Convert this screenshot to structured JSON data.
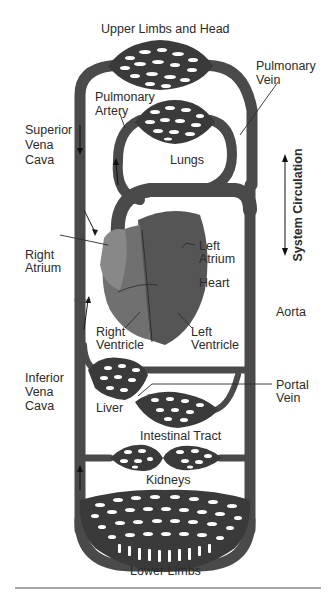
{
  "diagram": {
    "labels": {
      "upper_limbs": "Upper Limbs and Head",
      "pulmonary_vein": [
        "Pulmonary",
        "Vein"
      ],
      "pulmonary_artery": [
        "Pulmonary",
        "Artery"
      ],
      "superior_vena_cava": [
        "Superior",
        "Vena",
        "Cava"
      ],
      "lungs": "Lungs",
      "system_circulation": "System Circulation",
      "right_atrium": [
        "Right",
        "Atrium"
      ],
      "left_atrium": [
        "Left",
        "Atrium"
      ],
      "heart": "Heart",
      "aorta": "Aorta",
      "right_ventricle": [
        "Right",
        "Ventricle"
      ],
      "left_ventricle": [
        "Left",
        "Ventricle"
      ],
      "inferior_vena_cava": [
        "Inferior",
        "Vena",
        "Cava"
      ],
      "portal_vein": [
        "Portal",
        "Vein"
      ],
      "liver": "Liver",
      "intestinal_tract": "Intestinal Tract",
      "kidneys": "Kidneys",
      "lower_limbs": "Lower Limbs"
    },
    "colors": {
      "vessel": "#4a4a4a",
      "capillary_bed": "#3a3a3a",
      "heart_right": "#6e6e6e",
      "heart_left": "#555555",
      "text": "#2b2b2b",
      "separator": "#8a8a8a",
      "background": "#ffffff"
    }
  }
}
